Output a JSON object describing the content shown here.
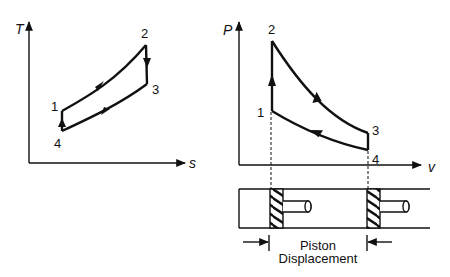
{
  "ts_diagram": {
    "y_axis_label": "T",
    "x_axis_label": "s",
    "points": [
      {
        "label": "1",
        "x": 62,
        "y": 111
      },
      {
        "label": "2",
        "x": 146,
        "y": 45
      },
      {
        "label": "3",
        "x": 147,
        "y": 84
      },
      {
        "label": "4",
        "x": 62,
        "y": 131
      }
    ]
  },
  "pv_diagram": {
    "y_axis_label": "P",
    "x_axis_label": "v",
    "points": [
      {
        "label": "1",
        "x": 272,
        "y": 111
      },
      {
        "label": "2",
        "x": 272,
        "y": 41
      },
      {
        "label": "3",
        "x": 368,
        "y": 133
      },
      {
        "label": "4",
        "x": 368,
        "y": 150
      }
    ]
  },
  "piston": {
    "caption_line1": "Piston",
    "caption_line2": "Displacement"
  },
  "colors": {
    "ink": "#111111",
    "background": "#ffffff"
  }
}
